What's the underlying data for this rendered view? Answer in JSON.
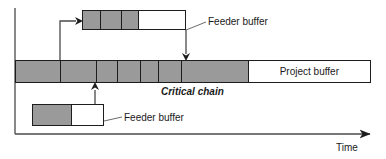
{
  "figure": {
    "type": "critical-chain-schedule",
    "axes": {
      "time_axis_label": "Time",
      "vertical_axis": "tasks",
      "x_axis_arrow": "right-arrow"
    },
    "colors": {
      "task_fill": "#9a9a9a",
      "buffer_fill": "#ffffff",
      "outline": "#1d1d1d",
      "text": "#1a1a1a"
    },
    "bars": [
      {
        "id": "top-feeding-chain",
        "name": "top-feeding-chain-bar",
        "x": 82,
        "y": 10,
        "width": 104,
        "height": 20,
        "segments": [
          {
            "kind": "task",
            "fill": "gray",
            "width": 18,
            "label": ""
          },
          {
            "kind": "task",
            "fill": "gray",
            "width": 22,
            "label": ""
          },
          {
            "kind": "task",
            "fill": "gray",
            "width": 17,
            "label": ""
          },
          {
            "kind": "buffer",
            "fill": "white",
            "width": 47,
            "label": ""
          }
        ]
      },
      {
        "id": "critical-chain",
        "name": "critical-chain-bar",
        "x": 15,
        "y": 60,
        "width": 356,
        "height": 23,
        "segments": [
          {
            "kind": "task",
            "fill": "gray",
            "width": 45,
            "label": ""
          },
          {
            "kind": "task",
            "fill": "gray",
            "width": 36,
            "label": ""
          },
          {
            "kind": "task",
            "fill": "gray",
            "width": 22,
            "label": ""
          },
          {
            "kind": "task",
            "fill": "gray",
            "width": 23,
            "label": ""
          },
          {
            "kind": "task",
            "fill": "gray",
            "width": 18,
            "label": ""
          },
          {
            "kind": "task",
            "fill": "gray",
            "width": 23,
            "label": ""
          },
          {
            "kind": "task",
            "fill": "gray",
            "width": 67,
            "label": ""
          },
          {
            "kind": "buffer",
            "fill": "white",
            "width": 122,
            "label": "Project buffer"
          }
        ]
      },
      {
        "id": "bottom-feeding-chain",
        "name": "bottom-feeding-chain-bar",
        "x": 32,
        "y": 104,
        "width": 72,
        "height": 22,
        "segments": [
          {
            "kind": "task",
            "fill": "gray",
            "width": 40,
            "label": ""
          },
          {
            "kind": "buffer",
            "fill": "white",
            "width": 32,
            "label": ""
          }
        ]
      }
    ],
    "labels": {
      "project_buffer": "Project buffer",
      "critical_chain": "Critical chain",
      "feeder_buffer_top": "Feeder buffer",
      "feeder_buffer_bottom": "Feeder buffer",
      "time": "Time"
    },
    "connectors": [
      {
        "name": "critical-chain-to-top-feeder",
        "type": "elbow-arrow",
        "from": "critical-chain",
        "to": "top-feeding-chain"
      },
      {
        "name": "top-feeder-to-critical-chain",
        "type": "down-arrow",
        "from": "top-feeding-chain",
        "to": "critical-chain"
      },
      {
        "name": "bottom-feeder-to-critical-chain",
        "type": "up-arrow",
        "from": "bottom-feeding-chain",
        "to": "critical-chain"
      },
      {
        "name": "top-feeder-buffer-leader-line",
        "type": "leader-line"
      },
      {
        "name": "bottom-feeder-buffer-leader-line",
        "type": "leader-line"
      }
    ]
  }
}
